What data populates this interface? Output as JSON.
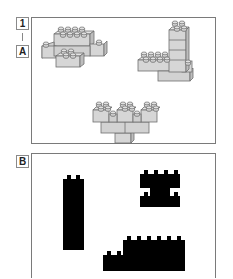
{
  "step": {
    "number_label": "1",
    "section_a_label": "A",
    "section_b_label": "B"
  },
  "panel_a": {
    "description": "Three grey brick assemblies drawn in 3D",
    "brick_fill": "#d6d6d6",
    "brick_stroke": "#6f6f6f",
    "models": [
      {
        "name": "flat-cross-model",
        "position": "top-left"
      },
      {
        "name": "l-tower-model",
        "position": "top-right"
      },
      {
        "name": "triple-stack-model",
        "position": "bottom-center"
      }
    ]
  },
  "panel_b": {
    "description": "Black silhouettes of the brick assemblies",
    "silhouette_fill": "#000000",
    "silhouettes": [
      {
        "name": "tall-column-silhouette",
        "position": "left"
      },
      {
        "name": "h-shape-silhouette",
        "position": "top-right"
      },
      {
        "name": "stepped-wall-silhouette",
        "position": "bottom-right"
      }
    ]
  }
}
